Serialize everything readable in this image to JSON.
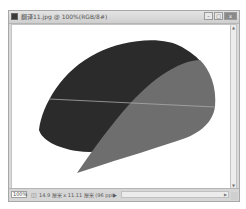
{
  "window": {
    "title": "翻译11.jpg @ 100%(RGB/8#)",
    "controls": {
      "minimize": "–",
      "maximize": "□",
      "close": "x"
    }
  },
  "canvas": {
    "background": "#ffffff",
    "shapes": [
      {
        "name": "dark-leaf-shape",
        "color": "#2b2b2b"
      },
      {
        "name": "gray-leaf-shape",
        "color": "#6e6e6e"
      },
      {
        "name": "guide-line",
        "color": "#a9a9a9"
      }
    ]
  },
  "scrollbar": {
    "up_arrow": "▲",
    "down_arrow": "▼",
    "right_arrow": "▶"
  },
  "statusbar": {
    "zoom": "100%",
    "doc_icon": "◫",
    "doc_info": "14.9 厘米 x 11.11 厘米 (96 ppi)",
    "info_arrow": "▶"
  }
}
